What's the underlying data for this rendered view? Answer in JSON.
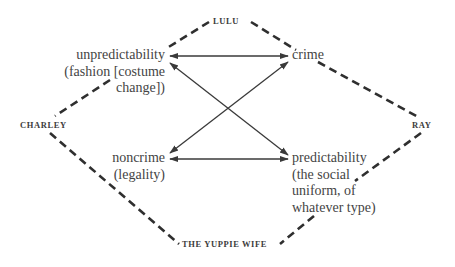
{
  "diagram": {
    "type": "semiotic-square",
    "characters": {
      "top": "LULU",
      "left": "CHARLEY",
      "right": "RAY",
      "bottom": "THE YUPPIE WIFE"
    },
    "terms": {
      "top_left": {
        "lines": [
          "unpredictability",
          "(fashion [costume",
          "change])"
        ]
      },
      "top_right": {
        "lines": [
          "crime"
        ]
      },
      "bottom_left": {
        "lines": [
          "noncrime",
          "(legality)"
        ]
      },
      "bottom_right": {
        "lines": [
          "predictability",
          "(the social",
          "uniform, of",
          "whatever type)"
        ]
      }
    },
    "relations": [
      {
        "from": "unpredictability",
        "to": "crime",
        "style": "double-arrow"
      },
      {
        "from": "noncrime",
        "to": "predictability",
        "style": "double-arrow"
      },
      {
        "from": "unpredictability",
        "to": "predictability",
        "style": "double-arrow"
      },
      {
        "from": "noncrime",
        "to": "crime",
        "style": "double-arrow"
      },
      {
        "from": "LULU",
        "to": "unpredictability",
        "style": "dashed"
      },
      {
        "from": "LULU",
        "to": "crime",
        "style": "dashed"
      },
      {
        "from": "CHARLEY",
        "to": "unpredictability",
        "style": "dashed"
      },
      {
        "from": "CHARLEY",
        "to": "THE YUPPIE WIFE",
        "style": "dashed"
      },
      {
        "from": "RAY",
        "to": "crime",
        "style": "dashed"
      },
      {
        "from": "RAY",
        "to": "predictability",
        "style": "dashed"
      },
      {
        "from": "THE YUPPIE WIFE",
        "to": "predictability",
        "style": "dashed"
      }
    ],
    "colors": {
      "ink": "#3a3a3a",
      "background": "#ffffff"
    }
  }
}
